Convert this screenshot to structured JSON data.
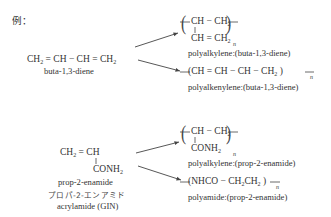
{
  "heading": "例：",
  "example1": {
    "monomer": {
      "formula_parts": [
        "CH",
        "2",
        " = CH − CH = CH",
        "2"
      ],
      "name": "buta-1,3-diene"
    },
    "products": [
      {
        "top_row": [
          "CH − CH",
          "2"
        ],
        "bottom_row": [
          "CH = CH",
          "2"
        ],
        "repeat": "n",
        "label": "polyalkylene:(buta-1,3-diene)"
      },
      {
        "chain": [
          "CH = CH − CH − CH",
          "2"
        ],
        "repeat": "n",
        "label": "polyalkenylene:(buta-1,3-diene)"
      }
    ]
  },
  "example2": {
    "monomer": {
      "top_row": [
        "CH",
        "2",
        " = CH"
      ],
      "substituent": [
        "CONH",
        "2"
      ],
      "name": "prop-2-enamide",
      "name_katakana": "プロパ-2-エンアミド",
      "common_name": "acrylamide  (GIN)"
    },
    "products": [
      {
        "top_row": [
          "CH − CH",
          "2"
        ],
        "substituent": [
          "CONH",
          "2"
        ],
        "repeat": "n",
        "label": "polyalkylene:(prop-2-enamide)"
      },
      {
        "chain": [
          "NHCO − CH",
          "2",
          "CH",
          "2"
        ],
        "repeat": "n",
        "label": "polyamide:(prop-2-enamide)"
      }
    ]
  },
  "colors": {
    "text": "#333333",
    "lines": "#444444",
    "background": "#ffffff"
  }
}
